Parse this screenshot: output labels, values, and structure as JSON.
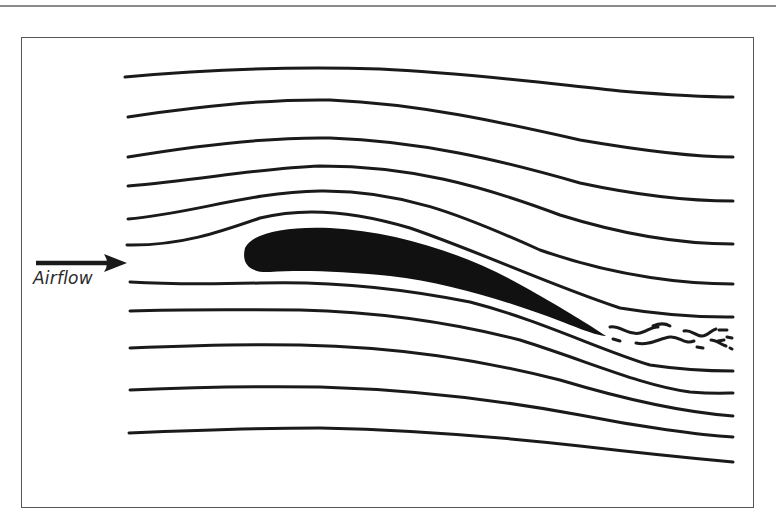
{
  "figure": {
    "type": "airfoil-streamline-diagram",
    "label": "Airflow",
    "arrow": "right-arrow",
    "streamline_count": 11,
    "airfoil": "cambered-wing-section",
    "wake": "turbulent-wake",
    "colors": {
      "ink": "#1a1a1a",
      "frame": "#555555",
      "background": "#ffffff"
    }
  }
}
